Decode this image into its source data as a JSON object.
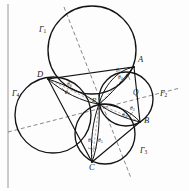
{
  "figure": {
    "kind": "geometry-diagram",
    "background_color": "#fdfdfd",
    "stroke_color": "#1a1a1a",
    "dash_color": "#555555"
  },
  "circles": [
    {
      "id": "G1",
      "label": "Γ1",
      "label_text": "Γ",
      "label_sub": "1",
      "cx": 92,
      "cy": 50,
      "r": 44
    },
    {
      "id": "G2",
      "label": "Γ2",
      "label_text": "Γ",
      "label_sub": "2",
      "cx": 126,
      "cy": 99,
      "r": 27
    },
    {
      "id": "G3",
      "label": "Γ3",
      "label_text": "Γ",
      "label_sub": "3",
      "cx": 105,
      "cy": 134,
      "r": 30
    },
    {
      "id": "G4",
      "label": "Γ4",
      "label_text": "Γ",
      "label_sub": "4",
      "cx": 53,
      "cy": 115,
      "r": 38
    }
  ],
  "circle_labels": [
    {
      "text": "Γ",
      "sub": "1",
      "x": 40,
      "y": 31
    },
    {
      "text": "Γ",
      "sub": "2",
      "x": 161,
      "y": 94
    },
    {
      "text": "Γ",
      "sub": "3",
      "x": 141,
      "y": 151
    },
    {
      "text": "Γ",
      "sub": "4",
      "x": 13,
      "y": 94
    }
  ],
  "points": [
    {
      "name": "A",
      "x": 134,
      "y": 67,
      "label_x": 138,
      "label_y": 59
    },
    {
      "name": "B",
      "x": 140,
      "y": 122,
      "label_x": 144,
      "label_y": 120
    },
    {
      "name": "C",
      "x": 92,
      "y": 162,
      "label_x": 89,
      "label_y": 165
    },
    {
      "name": "D",
      "x": 48,
      "y": 79,
      "label_x": 38,
      "label_y": 74
    },
    {
      "name": "P",
      "x": 99,
      "y": 104,
      "label_x": 93,
      "label_y": 99
    },
    {
      "name": "Q",
      "x": 132,
      "y": 98,
      "label_x": 134,
      "label_y": 92
    }
  ],
  "angles": [
    {
      "name": "θ",
      "sub": "1",
      "x": 117,
      "y": 71
    },
    {
      "name": "θ",
      "sub": "2",
      "x": 119,
      "y": 78
    },
    {
      "name": "θ",
      "sub": "3",
      "x": 132,
      "y": 110
    },
    {
      "name": "θ",
      "sub": "4",
      "x": 124,
      "y": 116
    },
    {
      "name": "θ",
      "sub": "5",
      "x": 99,
      "y": 141
    },
    {
      "name": "θ",
      "sub": "6",
      "x": 90,
      "y": 141
    },
    {
      "name": "θ",
      "sub": "7",
      "x": 66,
      "y": 93
    },
    {
      "name": "θ",
      "sub": "8",
      "x": 68,
      "y": 85
    }
  ],
  "quadrilateral": {
    "name": "ABCD",
    "vertices": [
      "A",
      "B",
      "C",
      "D"
    ],
    "path": "M134,67 L140,122 L92,162 L48,79 Z"
  },
  "petals": [
    {
      "id": "petal-A",
      "from": "P",
      "to": "A",
      "path": "M99,104 C104,86 117,70 134,67 C122,80 112,94 99,104 Z"
    },
    {
      "id": "petal-B",
      "from": "P",
      "to": "B",
      "path": "M99,104 C114,104 131,111 140,122 C124,118 109,112 99,104 Z"
    },
    {
      "id": "petal-C",
      "from": "P",
      "to": "C",
      "path": "M99,104 C100,121 98,146 92,162 C90,142 93,120 99,104 Z"
    },
    {
      "id": "petal-D",
      "from": "P",
      "to": "D",
      "path": "M99,104 C83,102 62,92 48,79 C66,85 85,94 99,104 Z"
    }
  ],
  "dashed_lines": [
    {
      "id": "diag-1",
      "x1": 64,
      "y1": 7,
      "x2": 131,
      "y2": 178
    },
    {
      "id": "diag-2",
      "x1": 8,
      "y1": 132,
      "x2": 180,
      "y2": 88
    },
    {
      "id": "ray-PA",
      "x1": 99,
      "y1": 104,
      "x2": 134,
      "y2": 67
    },
    {
      "id": "ray-PB",
      "x1": 99,
      "y1": 104,
      "x2": 140,
      "y2": 122
    },
    {
      "id": "ray-PC",
      "x1": 99,
      "y1": 104,
      "x2": 92,
      "y2": 162
    },
    {
      "id": "ray-PD",
      "x1": 99,
      "y1": 104,
      "x2": 48,
      "y2": 79
    }
  ],
  "border": {
    "left_x": 8,
    "top_y": 4,
    "bottom_y": 188
  }
}
